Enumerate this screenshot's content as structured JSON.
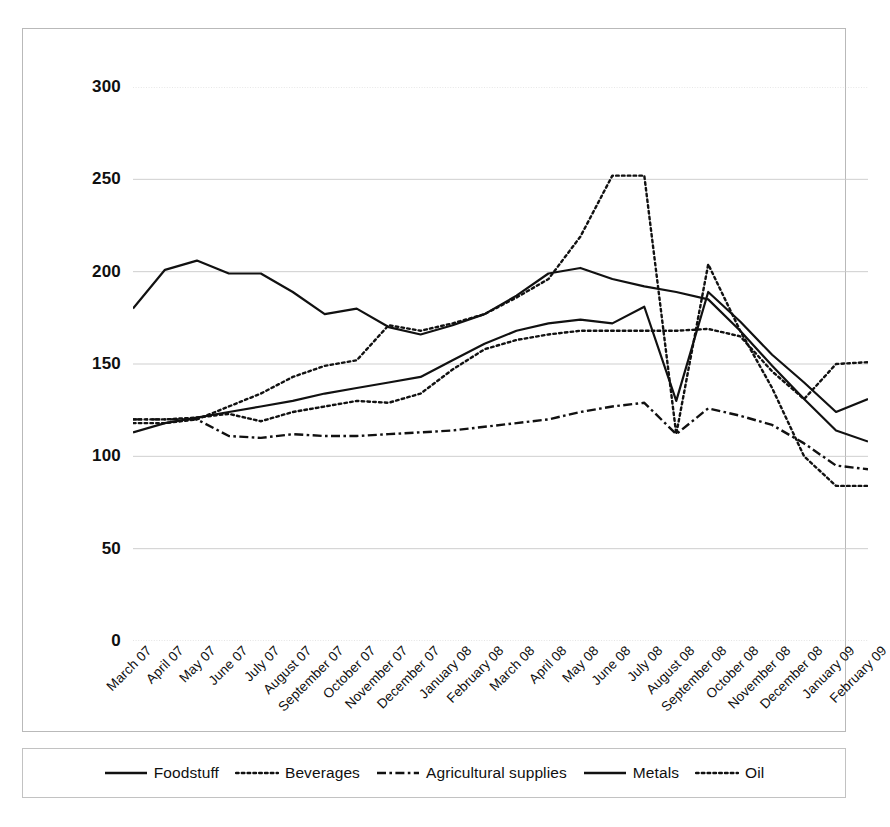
{
  "chart_data": {
    "type": "line",
    "title": "",
    "subtitle": "",
    "xlabel": "",
    "ylabel": "",
    "ylim": [
      0,
      300
    ],
    "ytick_labels": [
      "300",
      "250",
      "200",
      "150",
      "100",
      "50",
      "0"
    ],
    "ytick_values": [
      300,
      250,
      200,
      150,
      100,
      50,
      0
    ],
    "grid": true,
    "legend_position": "bottom",
    "categories": [
      "March 07",
      "April 07",
      "May 07",
      "June 07",
      "July 07",
      "August 07",
      "September 07",
      "October 07",
      "November 07",
      "December 07",
      "January 08",
      "February 08",
      "March 08",
      "April 08",
      "May 08",
      "June 08",
      "July 08",
      "August 08",
      "September 08",
      "October 08",
      "November 08",
      "December 08",
      "January 09",
      "February 09"
    ],
    "series": [
      {
        "name": "Foodstuff",
        "style": "solid",
        "color": "#111111",
        "values": [
          113,
          118,
          121,
          124,
          127,
          130,
          134,
          137,
          140,
          143,
          152,
          161,
          168,
          172,
          174,
          172,
          181,
          130,
          189,
          173,
          155,
          140,
          124,
          131
        ]
      },
      {
        "name": "Beverages",
        "style": "dotted",
        "color": "#111111",
        "values": [
          120,
          120,
          121,
          123,
          119,
          124,
          127,
          130,
          129,
          134,
          147,
          158,
          163,
          166,
          168,
          168,
          168,
          168,
          169,
          165,
          146,
          131,
          150,
          151
        ]
      },
      {
        "name": "Agricultural supplies",
        "style": "dashdot",
        "color": "#111111",
        "values": [
          120,
          120,
          120,
          111,
          110,
          112,
          111,
          111,
          112,
          113,
          114,
          116,
          118,
          120,
          124,
          127,
          129,
          112,
          126,
          122,
          117,
          107,
          95,
          93
        ]
      },
      {
        "name": "Metals",
        "style": "solid",
        "color": "#111111",
        "values": [
          180,
          201,
          206,
          199,
          199,
          189,
          177,
          180,
          170,
          166,
          171,
          177,
          187,
          199,
          202,
          196,
          192,
          189,
          185,
          168,
          149,
          131,
          114,
          108
        ]
      },
      {
        "name": "Oil",
        "style": "dotted",
        "color": "#111111",
        "values": [
          118,
          118,
          120,
          127,
          134,
          143,
          149,
          152,
          171,
          168,
          172,
          177,
          186,
          196,
          219,
          252,
          252,
          112,
          204,
          168,
          137,
          100,
          84,
          84
        ]
      }
    ]
  },
  "legend": {
    "items": [
      {
        "label": "Foodstuff",
        "style": "solid"
      },
      {
        "label": "Beverages",
        "style": "dotted"
      },
      {
        "label": "Agricultural supplies",
        "style": "dashdot"
      },
      {
        "label": "Metals",
        "style": "solid"
      },
      {
        "label": "Oil",
        "style": "dotted"
      }
    ]
  }
}
